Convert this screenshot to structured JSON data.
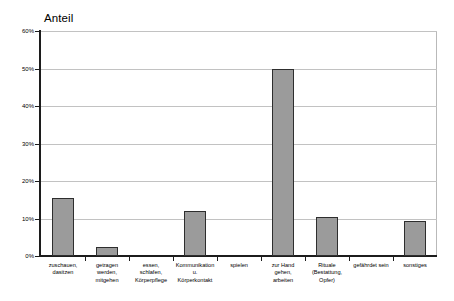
{
  "chart_data": {
    "type": "bar",
    "title": "Anteil",
    "xlabel": "",
    "ylabel": "",
    "ylim": [
      0,
      60
    ],
    "grid": true,
    "legend": false,
    "y_tick_labels": [
      "0%",
      "10%",
      "20%",
      "30%",
      "40%",
      "50%",
      "60%"
    ],
    "y_tick_values": [
      0,
      10,
      20,
      30,
      40,
      50,
      60
    ],
    "categories": [
      "zuschauen,\ndasitzen",
      "getragen\nwerden,\nmitgehen",
      "essen,\nschlafen,\nKörperpflege",
      "Kommunikation\nu.\nKörperkontakt",
      "spielen",
      "zur Hand\ngehen,\narbeiten",
      "Rituale\n(Bestattung,\nOpfer)",
      "gefährdet sein",
      "sonstiges"
    ],
    "values": [
      15.6,
      2.5,
      0,
      12.0,
      0,
      50.0,
      10.3,
      0,
      9.4
    ],
    "bar_fill_color": "#9b9b9b",
    "bar_border_color": "#2e2e2e",
    "axis_color": "#1c1c1c",
    "gridline_color": "#c2c2c2",
    "background_color": "#ffffff"
  }
}
